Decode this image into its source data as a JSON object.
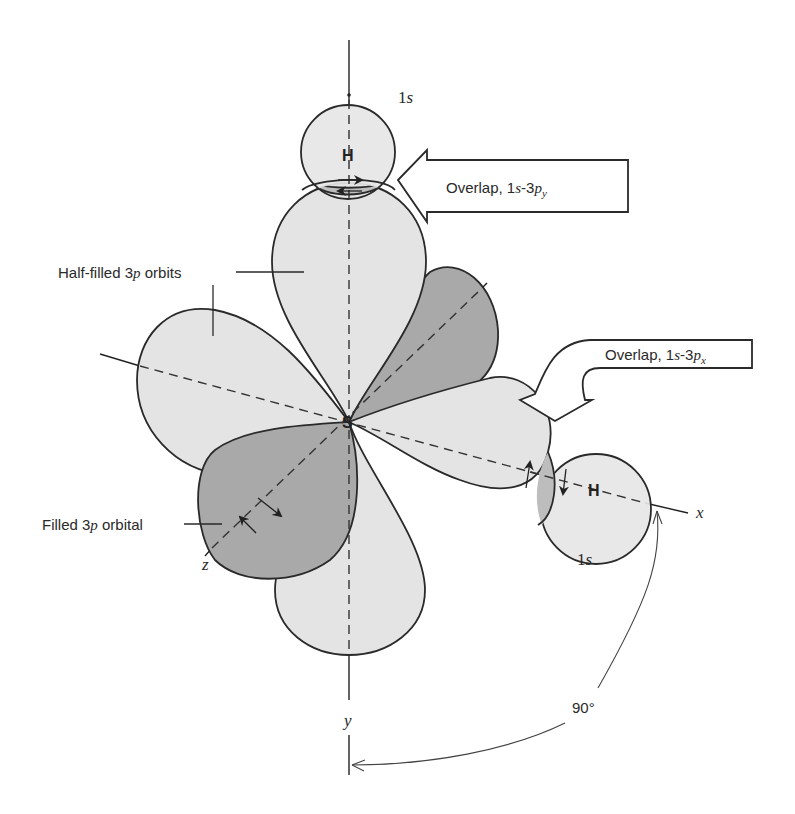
{
  "diagram": {
    "central_atom": {
      "label": "S"
    },
    "hydrogen_top": {
      "atom_label": "H",
      "orbital_label": "1s"
    },
    "hydrogen_right": {
      "atom_label": "H",
      "orbital_label": "1s"
    },
    "axes": {
      "x": "x",
      "y": "y",
      "z": "z"
    },
    "callouts": {
      "overlap_py": {
        "prefix": "Overlap, 1",
        "s": "s",
        "mid": "-3",
        "p": "p",
        "sub": "y"
      },
      "overlap_px": {
        "prefix": "Overlap, 1",
        "s": "s",
        "mid": "-3",
        "p": "p",
        "sub": "x"
      }
    },
    "labels": {
      "half_filled": {
        "pre": "Half-filled 3",
        "p": "p",
        "post": " orbits"
      },
      "filled": {
        "pre": "Filled 3",
        "p": "p",
        "post": " orbital"
      }
    },
    "angle_label": "90°",
    "colors": {
      "light_lobe": "#e4e4e4",
      "dark_lobe": "#a9a9a9",
      "overlap": "#bdbdbd",
      "stroke": "#2a2a2a"
    }
  }
}
